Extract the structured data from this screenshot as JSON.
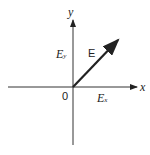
{
  "diagram": {
    "title": "",
    "axes": {
      "x_label": "x",
      "y_label": "y",
      "origin_label": "0"
    },
    "vector": {
      "label": "E",
      "x_component": {
        "symbol": "E",
        "subscript": "x"
      },
      "y_component": {
        "symbol": "E",
        "subscript": "y"
      }
    },
    "colors": {
      "stroke": "#222222",
      "background": "#ffffff"
    }
  }
}
